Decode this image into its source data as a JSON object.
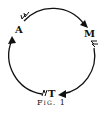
{
  "diagram": {
    "nodes": [
      {
        "id": "A",
        "label": "A"
      },
      {
        "id": "M",
        "label": "M"
      },
      {
        "id": "T",
        "label": "T"
      }
    ],
    "edges": [
      {
        "from": "A",
        "to": "M"
      },
      {
        "from": "M",
        "to": "T"
      },
      {
        "from": "T",
        "to": "A"
      }
    ],
    "caption": "Fig. 1",
    "stroke_color": "#111111"
  }
}
